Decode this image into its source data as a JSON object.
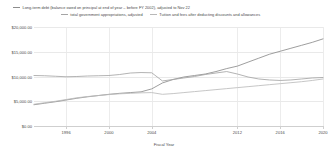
{
  "chart_data": {
    "type": "line",
    "title": "",
    "xlabel": "Fiscal Year",
    "ylabel": "",
    "xlim": [
      1993,
      2020
    ],
    "ylim": [
      0,
      20000
    ],
    "grid": true,
    "legend_position": "top",
    "y_tick_labels": [
      "$20,000.00",
      "$15,000.00",
      "$10,000.00",
      "$5,000.00",
      "$0.00"
    ],
    "y_ticks": [
      20000,
      15000,
      10000,
      5000,
      0
    ],
    "x_tick_labels": [
      "1996",
      "2000",
      "2004",
      "2012",
      "2016",
      "2020"
    ],
    "x_ticks": [
      1996,
      2000,
      2004,
      2012,
      2016,
      2020
    ],
    "x": [
      1993,
      1994,
      1995,
      1996,
      1997,
      1998,
      1999,
      2000,
      2001,
      2002,
      2003,
      2004,
      2005,
      2006,
      2007,
      2008,
      2009,
      2010,
      2011,
      2012,
      2013,
      2014,
      2015,
      2016,
      2017,
      2018,
      2019,
      2020
    ],
    "series": [
      {
        "name": "Long-term debt (balance owed on principal at end of year – before FY 2002), adjusted to Nov 22",
        "color": "#8d8d8d",
        "values": [
          4300,
          4600,
          4900,
          5250,
          5600,
          5900,
          6150,
          6400,
          6600,
          6750,
          6900,
          7500,
          8700,
          9400,
          9900,
          10200,
          10500,
          11000,
          11600,
          12100,
          12900,
          13700,
          14500,
          15100,
          15700,
          16300,
          16900,
          17600
        ]
      },
      {
        "name": "total government appropriations, adjusted",
        "color": "#a5a5a5",
        "values": [
          10200,
          10150,
          10050,
          9950,
          10000,
          10100,
          10150,
          10200,
          10400,
          10700,
          10800,
          10750,
          9100,
          9400,
          9700,
          10000,
          10400,
          10700,
          11000,
          10500,
          9900,
          9500,
          9300,
          9200,
          9300,
          9500,
          9700,
          9800
        ]
      },
      {
        "name": "Tuition and fees after deducting discounts and allowances",
        "color": "#bcbcbc",
        "values": [
          4400,
          4700,
          5000,
          5350,
          5700,
          5950,
          6150,
          6350,
          6500,
          6600,
          6700,
          6750,
          6400,
          6550,
          6750,
          6950,
          7150,
          7350,
          7550,
          7750,
          7950,
          8150,
          8350,
          8550,
          8750,
          8950,
          9200,
          9500
        ]
      }
    ]
  }
}
